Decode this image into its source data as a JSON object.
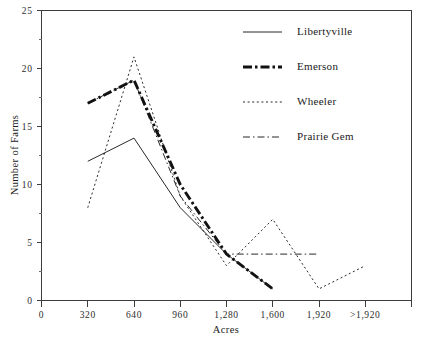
{
  "chart_data": {
    "type": "line",
    "title": "",
    "xlabel": "Acres",
    "ylabel": "Number of Farms",
    "categories": [
      "0",
      "320",
      "640",
      "960",
      "1,280",
      "1,600",
      "1,920",
      ">1,920"
    ],
    "x_tick_labels": [
      "0",
      "320",
      "640",
      "960",
      "1,280",
      "1,600",
      "1,920",
      ">1,920"
    ],
    "y_tick_labels": [
      "0",
      "5",
      "10",
      "15",
      "20",
      "25"
    ],
    "y_tick_values": [
      0,
      5,
      10,
      15,
      20,
      25
    ],
    "ylim": [
      0,
      25
    ],
    "xlim": [
      0,
      7
    ],
    "grid": false,
    "legend_position": "top-right",
    "minor_ticks": true,
    "series": [
      {
        "name": "Libertyville",
        "style": "solid",
        "x": [
          "320",
          "640",
          "960",
          "1,280",
          "1,600"
        ],
        "values": [
          12,
          14,
          8,
          4,
          1
        ]
      },
      {
        "name": "Emerson",
        "style": "thick-dash-dot",
        "x": [
          "320",
          "640",
          "960",
          "1,280",
          "1,600"
        ],
        "values": [
          17,
          19,
          10,
          4,
          1
        ]
      },
      {
        "name": "Wheeler",
        "style": "dotted",
        "x": [
          "320",
          "640",
          "960",
          "1,280",
          "1,600",
          "1,920",
          ">1,920"
        ],
        "values": [
          8,
          21,
          9,
          3,
          7,
          1,
          3
        ]
      },
      {
        "name": "Prairie Gem",
        "style": "thin-dash-dot",
        "x": [
          "320",
          "640",
          "960",
          "1,280",
          "1,600",
          "1,920"
        ],
        "values": [
          17,
          19,
          9,
          4,
          4,
          4
        ]
      }
    ]
  },
  "legend": {
    "entries": [
      {
        "label": "Libertyville",
        "style": "solid"
      },
      {
        "label": "Emerson",
        "style": "thick-dash-dot"
      },
      {
        "label": "Wheeler",
        "style": "dotted"
      },
      {
        "label": "Prairie Gem",
        "style": "thin-dash-dot"
      }
    ]
  },
  "colors": {
    "ink": "#111111",
    "axis": "#3c3c3c",
    "background": "#ffffff"
  }
}
